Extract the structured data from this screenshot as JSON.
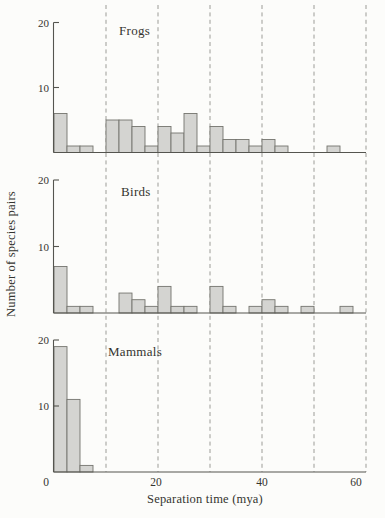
{
  "figure": {
    "ylabel": "Number of species pairs",
    "xlabel": "Separation time (mya)",
    "colors": {
      "background": "#fcfcfa",
      "bar_fill": "#d4d4d1",
      "bar_stroke": "#74746e",
      "axis": "#55554f",
      "grid": "#92928c",
      "text": "#34342f"
    }
  },
  "y_axis": {
    "range": [
      0,
      20
    ],
    "tick_labels": [
      "10",
      "20"
    ]
  },
  "x_axis": {
    "range_mya": [
      0,
      60
    ],
    "tick_labels": [
      "0",
      "20",
      "40",
      "60"
    ],
    "gridlines_mya": [
      10,
      20,
      30,
      40,
      50,
      60
    ]
  },
  "chart_data": [
    {
      "type": "bar",
      "title": "Frogs",
      "ylabel": "Number of species pairs",
      "xlabel": "Separation time (mya)",
      "ylim": [
        0,
        20
      ],
      "yticks": [
        10,
        20
      ],
      "bin_width_mya": 2.5,
      "bin_starts_mya": [
        0,
        2.5,
        5,
        7.5,
        10,
        12.5,
        15,
        17.5,
        20,
        22.5,
        25,
        27.5,
        30,
        32.5,
        35,
        37.5,
        40,
        42.5,
        45,
        47.5,
        50,
        52.5,
        55,
        57.5
      ],
      "values": [
        6,
        1,
        1,
        0,
        5,
        5,
        4,
        1,
        4,
        3,
        6,
        1,
        4,
        2,
        2,
        1,
        2,
        1,
        0,
        0,
        0,
        1,
        0,
        0
      ]
    },
    {
      "type": "bar",
      "title": "Birds",
      "ylabel": "Number of species pairs",
      "xlabel": "Separation time (mya)",
      "ylim": [
        0,
        20
      ],
      "yticks": [
        10,
        20
      ],
      "bin_width_mya": 2.5,
      "bin_starts_mya": [
        0,
        2.5,
        5,
        7.5,
        10,
        12.5,
        15,
        17.5,
        20,
        22.5,
        25,
        27.5,
        30,
        32.5,
        35,
        37.5,
        40,
        42.5,
        45,
        47.5,
        50,
        52.5,
        55,
        57.5
      ],
      "values": [
        7,
        1,
        1,
        0,
        0,
        3,
        2,
        1,
        4,
        1,
        1,
        0,
        4,
        1,
        0,
        1,
        2,
        1,
        0,
        1,
        0,
        0,
        1,
        0
      ]
    },
    {
      "type": "bar",
      "title": "Mammals",
      "ylabel": "Number of species pairs",
      "xlabel": "Separation time (mya)",
      "ylim": [
        0,
        20
      ],
      "yticks": [
        10,
        20
      ],
      "bin_width_mya": 2.5,
      "bin_starts_mya": [
        0,
        2.5,
        5,
        7.5,
        10,
        12.5,
        15,
        17.5,
        20,
        22.5,
        25,
        27.5,
        30,
        32.5,
        35,
        37.5,
        40,
        42.5,
        45,
        47.5,
        50,
        52.5,
        55,
        57.5
      ],
      "values": [
        19,
        11,
        1,
        0,
        0,
        0,
        0,
        0,
        0,
        0,
        0,
        0,
        0,
        0,
        0,
        0,
        0,
        0,
        0,
        0,
        0,
        0,
        0,
        0
      ]
    }
  ]
}
